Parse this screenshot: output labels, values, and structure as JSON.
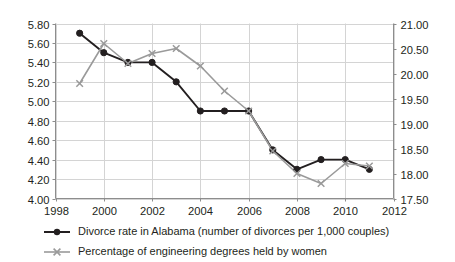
{
  "chart_data": {
    "type": "line",
    "title": "",
    "xlabel": "",
    "ylabel": "",
    "grid": true,
    "legend_position": "bottom-left",
    "x": [
      1999,
      2000,
      2001,
      2002,
      2003,
      2004,
      2005,
      2006,
      2007,
      2008,
      2009,
      2010,
      2011
    ],
    "xlim": [
      1998,
      2012
    ],
    "xticks": [
      "1998",
      "2000",
      "2002",
      "2004",
      "2006",
      "2008",
      "2010",
      "2012"
    ],
    "xtick_values": [
      1998,
      2000,
      2002,
      2004,
      2006,
      2008,
      2010,
      2012
    ],
    "axes": {
      "left": {
        "ylim": [
          4.0,
          5.8
        ],
        "yticks": [
          "4.00",
          "4.20",
          "4.40",
          "4.60",
          "4.80",
          "5.00",
          "5.20",
          "5.40",
          "5.60",
          "5.80"
        ],
        "ytick_values": [
          4.0,
          4.2,
          4.4,
          4.6,
          4.8,
          5.0,
          5.2,
          5.4,
          5.6,
          5.8
        ]
      },
      "right": {
        "ylim": [
          17.5,
          21.0
        ],
        "yticks": [
          "17.50",
          "18.00",
          "18.50",
          "19.00",
          "19.50",
          "20.00",
          "20.50",
          "21.00"
        ],
        "ytick_values": [
          17.5,
          18.0,
          18.5,
          19.0,
          19.5,
          20.0,
          20.5,
          21.0
        ]
      }
    },
    "series": [
      {
        "name": "Divorce rate in Alabama (number of divorces per 1,000 couples)",
        "axis": "left",
        "color": "#231f20",
        "marker": "circle",
        "values": [
          5.7,
          5.5,
          5.4,
          5.4,
          5.2,
          4.9,
          4.9,
          4.9,
          4.5,
          4.3,
          4.4,
          4.4,
          4.3
        ]
      },
      {
        "name": "Percentage of engineering degrees held by women",
        "axis": "right",
        "color": "#9a9a9a",
        "marker": "x",
        "values": [
          19.8,
          20.6,
          20.2,
          20.4,
          20.5,
          20.15,
          19.65,
          19.25,
          18.45,
          18.0,
          17.8,
          18.2,
          18.15
        ]
      }
    ]
  },
  "colors": {
    "series_1": "#231f20",
    "series_2": "#9a9a9a",
    "grid": "#d4d4d4",
    "axis": "#8d8d8d",
    "text": "#231f20",
    "background": "#ffffff"
  },
  "legend": {
    "items": [
      {
        "label": "Divorce rate in Alabama (number of divorces per 1,000 couples)",
        "marker": "circle-line-marker",
        "color": "#231f20"
      },
      {
        "label": "Percentage of engineering degrees held by women",
        "marker": "x-line-marker",
        "color": "#9a9a9a"
      }
    ]
  }
}
